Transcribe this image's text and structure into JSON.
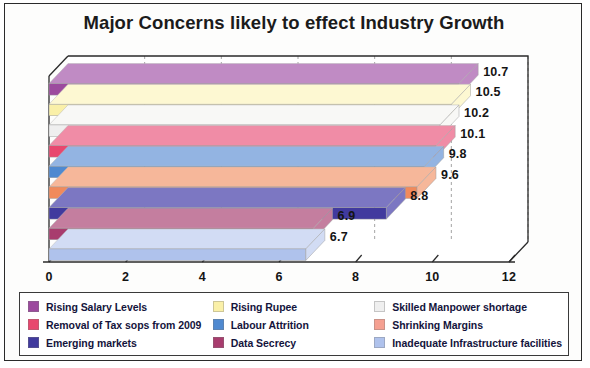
{
  "chart_data": {
    "type": "bar",
    "orientation": "horizontal",
    "title": "Major Concerns likely to effect Industry Growth",
    "xlabel": "",
    "ylabel": "",
    "xlim": [
      0,
      12
    ],
    "xticks": [
      "0",
      "2",
      "4",
      "6",
      "8",
      "10",
      "12"
    ],
    "grid": true,
    "legend_position": "bottom",
    "style": "3d-horizontal-bars",
    "categories": [
      "Rising Salary Levels",
      "Rising Rupee",
      "Skilled Manpower shortage",
      "Removal of Tax sops from 2009",
      "Labour Attrition",
      "Shrinking Margins",
      "Emerging markets",
      "Data Secrecy",
      "Inadequate Infrastructure facilities"
    ],
    "values": [
      10.7,
      10.5,
      10.2,
      10.1,
      9.8,
      9.6,
      8.8,
      6.9,
      6.7
    ],
    "value_labels": [
      "10.7",
      "10.5",
      "10.2",
      "10.1",
      "9.8",
      "9.6",
      "8.8",
      "6.9",
      "6.7"
    ],
    "colors": [
      "#9C4A9E",
      "#FAF0A8",
      "#EFEFEF",
      "#E8476E",
      "#4F89D0",
      "#F08A5C",
      "#413A9E",
      "#A83C6E",
      "#AFC2EC"
    ],
    "top_colors": [
      "#C08BC4",
      "#FDF8D2",
      "#F8F8F6",
      "#F08CA6",
      "#93B4E2",
      "#F6B79A",
      "#7C77C2",
      "#C47E9F",
      "#D2DCF4"
    ]
  },
  "legend": {
    "columns": [
      [
        {
          "label": "Rising Salary Levels",
          "color": "#9C4A9E"
        },
        {
          "label": "Removal of Tax sops from 2009",
          "color": "#E8476E"
        },
        {
          "label": "Emerging markets",
          "color": "#413A9E"
        }
      ],
      [
        {
          "label": "Rising Rupee",
          "color": "#FAF0A8"
        },
        {
          "label": "Labour Attrition",
          "color": "#4F89D0"
        },
        {
          "label": "Data Secrecy",
          "color": "#A83C6E"
        }
      ],
      [
        {
          "label": "Skilled Manpower shortage",
          "color": "#EFEFEF"
        },
        {
          "label": "Shrinking Margins",
          "color": "#F5A091"
        },
        {
          "label": "Inadequate Infrastructure facilities",
          "color": "#AFC2EC"
        }
      ]
    ]
  }
}
